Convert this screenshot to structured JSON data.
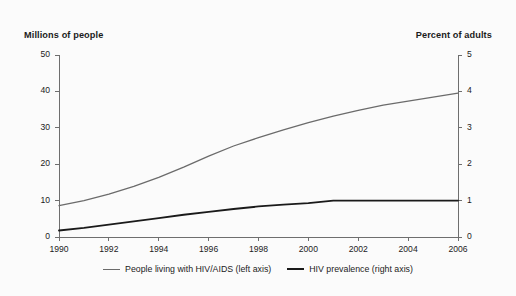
{
  "chart_data": {
    "type": "line",
    "title": "",
    "xlabel": "",
    "ylabel_left": "Millions of people",
    "ylabel_right": "Percent of adults",
    "x": [
      1990,
      1991,
      1992,
      1993,
      1994,
      1995,
      1996,
      1997,
      1998,
      1999,
      2000,
      2001,
      2002,
      2003,
      2004,
      2005,
      2006
    ],
    "xlim": [
      1990,
      2006
    ],
    "xticks": [
      1990,
      1992,
      1994,
      1996,
      1998,
      2000,
      2002,
      2004,
      2006
    ],
    "xtick_labels": [
      "1990",
      "1992",
      "1994",
      "1996",
      "1998",
      "2000",
      "2002",
      "2004",
      "2006"
    ],
    "ylim_left": [
      0,
      50
    ],
    "yticks_left": [
      0,
      10,
      20,
      30,
      40,
      50
    ],
    "ytick_labels_left": [
      "0",
      "10",
      "20",
      "30",
      "40",
      "50"
    ],
    "ylim_right": [
      0,
      5
    ],
    "yticks_right": [
      0,
      1,
      2,
      3,
      4,
      5
    ],
    "ytick_labels_right": [
      "0",
      "1",
      "2",
      "3",
      "4",
      "5"
    ],
    "grid": false,
    "legend_position": "bottom",
    "series": [
      {
        "name": "People living with HIV/AIDS (left axis)",
        "axis": "left",
        "color": "#6b6b6b",
        "width": 1.3,
        "values": [
          8.6,
          10.0,
          11.8,
          13.9,
          16.4,
          19.2,
          22.2,
          25.0,
          27.3,
          29.4,
          31.4,
          33.2,
          34.8,
          36.2,
          37.3,
          38.4,
          39.5
        ]
      },
      {
        "name": "HIV prevalence (right axis)",
        "axis": "right",
        "color": "#1a1a1a",
        "width": 1.9,
        "values": [
          0.18,
          0.25,
          0.34,
          0.43,
          0.52,
          0.61,
          0.69,
          0.77,
          0.84,
          0.89,
          0.93,
          1.0,
          1.0,
          1.0,
          1.0,
          1.0,
          1.0
        ]
      }
    ]
  },
  "legend": {
    "entries": [
      {
        "label": "People living with HIV/AIDS (left axis)",
        "swatch": "line-swatch-grey"
      },
      {
        "label": "HIV prevalence (right axis)",
        "swatch": "line-swatch-black"
      }
    ]
  },
  "colors": {
    "background": "#fbfbfb",
    "axis": "#6e6e6e",
    "text": "#1c1c1c",
    "series_hiv_aids": "#6b6b6b",
    "series_prevalence": "#1a1a1a"
  }
}
